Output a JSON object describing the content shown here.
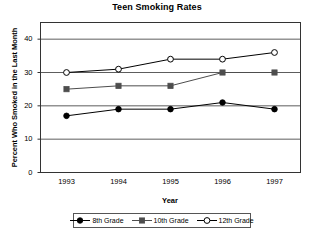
{
  "chart_data": {
    "type": "line",
    "title": "Teen Smoking Rates",
    "xlabel": "Year",
    "ylabel": "Percent Who Smoked in the Last Month",
    "categories": [
      "1993",
      "1994",
      "1995",
      "1996",
      "1997"
    ],
    "x": [
      1993,
      1994,
      1995,
      1996,
      1997
    ],
    "series": [
      {
        "name": "8th Grade",
        "values": [
          17,
          19,
          19,
          21,
          19
        ],
        "marker": "filled-circle",
        "color": "#000000"
      },
      {
        "name": "10th Grade",
        "values": [
          25,
          26,
          26,
          30,
          30
        ],
        "marker": "filled-square",
        "color": "#4d4d4d"
      },
      {
        "name": "12th Grade",
        "values": [
          30,
          31,
          34,
          34,
          36
        ],
        "marker": "open-circle",
        "color": "#000000"
      }
    ],
    "ylim": [
      0,
      45
    ],
    "yticks": [
      0,
      10,
      20,
      30,
      40
    ],
    "ytick_labels": [
      "0",
      "10",
      "20",
      "30",
      "40"
    ],
    "xtick_labels": [
      "1993",
      "1994",
      "1995",
      "1996",
      "1997"
    ],
    "grid": "horizontal",
    "legend_position": "bottom-center",
    "legend_entries": [
      "8th Grade",
      "10th Grade",
      "12th Grade"
    ]
  }
}
